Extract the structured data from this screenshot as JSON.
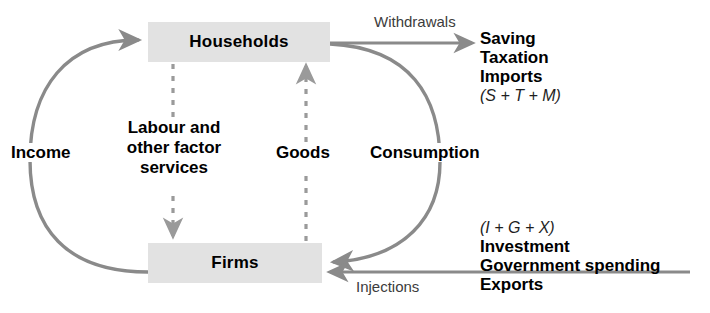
{
  "diagram": {
    "colors": {
      "box_fill": "#e2e2e2",
      "arrow_gray": "#8a8a8a",
      "text_black": "#000000",
      "label_gray": "#3c3c3c",
      "background": "#ffffff"
    },
    "nodes": [
      {
        "id": "households",
        "label": "Households"
      },
      {
        "id": "firms",
        "label": "Firms"
      }
    ],
    "flows": [
      {
        "id": "income",
        "label": "Income",
        "style": "solid-curve",
        "weight": "bold"
      },
      {
        "id": "consumption",
        "label": "Consumption",
        "style": "solid-curve",
        "weight": "bold"
      },
      {
        "id": "labour",
        "label": "Labour and\nother factor\nservices",
        "line1": "Labour and",
        "line2": "other factor",
        "line3": "services",
        "style": "dashed",
        "weight": "bold"
      },
      {
        "id": "goods",
        "label": "Goods",
        "style": "dashed",
        "weight": "bold"
      },
      {
        "id": "withdrawals",
        "label": "Withdrawals",
        "style": "solid-straight",
        "weight": "normal"
      },
      {
        "id": "injections",
        "label": "Injections",
        "style": "solid-straight",
        "weight": "normal"
      }
    ],
    "withdrawals_block": {
      "items": [
        "Saving",
        "Taxation",
        "Imports"
      ],
      "formula": "(S + T + M)"
    },
    "injections_block": {
      "formula": "(I + G + X)",
      "items": [
        "Investment",
        "Government spending",
        "Exports"
      ]
    }
  }
}
